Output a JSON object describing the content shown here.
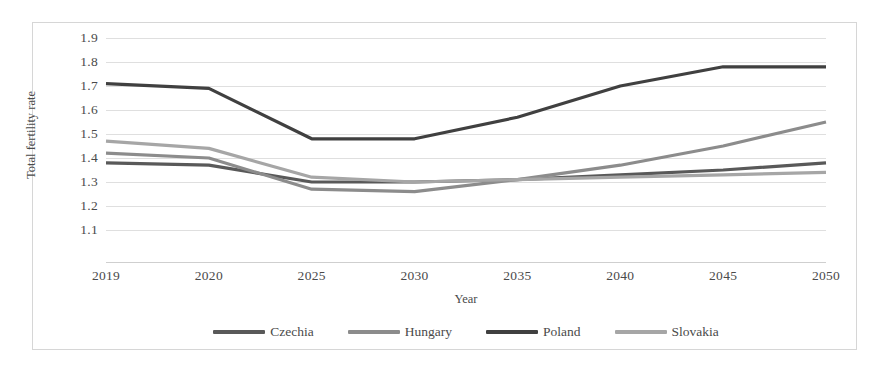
{
  "chart_data": {
    "type": "line",
    "title": "",
    "xlabel": "Year",
    "ylabel": "Total fertility rate",
    "categories": [
      "2019",
      "2020",
      "2025",
      "2030",
      "2035",
      "2040",
      "2045",
      "2050"
    ],
    "ylim": [
      1.1,
      1.9
    ],
    "y_ticks": [
      "1.9",
      "1.8",
      "1.7",
      "1.6",
      "1.5",
      "1.4",
      "1.3",
      "1.2",
      "1.1"
    ],
    "y_tick_values": [
      1.9,
      1.8,
      1.7,
      1.6,
      1.5,
      1.4,
      1.3,
      1.2,
      1.1
    ],
    "grid": true,
    "legend_position": "bottom",
    "series": [
      {
        "name": "Czechia",
        "color": "#595959",
        "values": [
          1.38,
          1.37,
          1.3,
          1.3,
          1.31,
          1.33,
          1.35,
          1.38
        ]
      },
      {
        "name": "Hungary",
        "color": "#8c8c8c",
        "values": [
          1.42,
          1.4,
          1.27,
          1.26,
          1.31,
          1.37,
          1.45,
          1.55
        ]
      },
      {
        "name": "Poland",
        "color": "#404040",
        "values": [
          1.71,
          1.69,
          1.48,
          1.48,
          1.57,
          1.7,
          1.78,
          1.78
        ]
      },
      {
        "name": "Slovakia",
        "color": "#a6a6a6",
        "values": [
          1.47,
          1.44,
          1.32,
          1.3,
          1.31,
          1.32,
          1.33,
          1.34
        ]
      }
    ]
  }
}
